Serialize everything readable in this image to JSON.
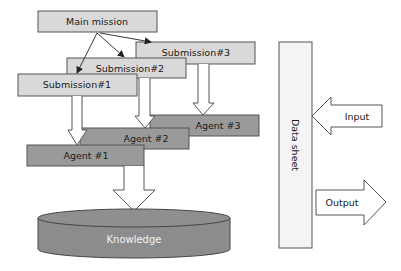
{
  "diagram": {
    "main_mission": "Main mission",
    "submissions": [
      "Submission#1",
      "Submission#2",
      "Submission#3"
    ],
    "agents": [
      "Agent #1",
      "Agent #2",
      "Agent #3"
    ],
    "knowledge": "Knowledge",
    "data_sheet": "Data sheet",
    "input": "Input",
    "output": "Output"
  },
  "colors": {
    "light_box": "#d9d9d9",
    "dark_box": "#9a9a9a",
    "knowledge": "#8c8c8c",
    "stroke": "#555555"
  }
}
